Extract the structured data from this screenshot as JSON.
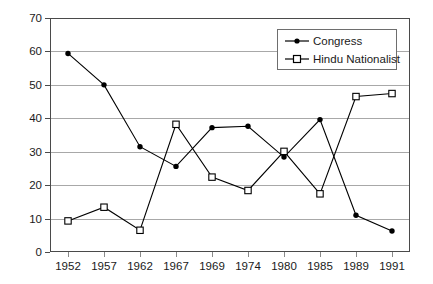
{
  "chart_data": {
    "type": "line",
    "title": "",
    "xlabel": "",
    "ylabel": "",
    "ylim": [
      0,
      70
    ],
    "ytick_step": 10,
    "yticks": [
      0,
      10,
      20,
      30,
      40,
      50,
      60,
      70
    ],
    "grid": true,
    "legend_position": "top-right",
    "categories": [
      "1952",
      "1957",
      "1962",
      "1967",
      "1969",
      "1974",
      "1980",
      "1985",
      "1989",
      "1991"
    ],
    "series": [
      {
        "name": "Congress",
        "marker": "filled-circle",
        "color": "#000000",
        "values": [
          59.4,
          50.0,
          31.5,
          25.6,
          37.2,
          37.6,
          28.4,
          39.6,
          11.0,
          6.3
        ]
      },
      {
        "name": "Hindu Nationalist",
        "marker": "open-square",
        "color": "#000000",
        "values": [
          9.3,
          13.4,
          6.5,
          38.2,
          22.4,
          18.4,
          30.1,
          17.4,
          46.5,
          47.4
        ]
      }
    ]
  },
  "legend": {
    "items": [
      {
        "label": "Congress",
        "marker": "filled-circle"
      },
      {
        "label": "Hindu Nationalist",
        "marker": "open-square"
      }
    ]
  },
  "axis": {
    "y_labels": [
      "70",
      "60",
      "50",
      "40",
      "30",
      "20",
      "10",
      "0"
    ],
    "x_labels": [
      "1952",
      "1957",
      "1962",
      "1967",
      "1969",
      "1974",
      "1980",
      "1985",
      "1989",
      "1991"
    ]
  }
}
